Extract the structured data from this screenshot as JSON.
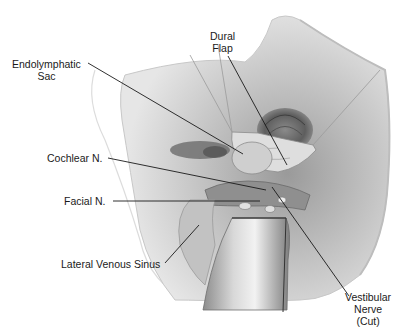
{
  "figure": {
    "labels": [
      {
        "id": "endolymphatic-sac",
        "lines": [
          "Endolymphatic",
          "Sac"
        ]
      },
      {
        "id": "dural-flap",
        "lines": [
          "Dural",
          "Flap"
        ]
      },
      {
        "id": "cochlear-n",
        "lines": [
          "Cochlear N."
        ]
      },
      {
        "id": "facial-n",
        "lines": [
          "Facial N."
        ]
      },
      {
        "id": "lateral-venous-sinus",
        "lines": [
          "Lateral Venous Sinus"
        ]
      },
      {
        "id": "vestibular-nerve",
        "lines": [
          "Vestibular",
          "Nerve",
          "(Cut)"
        ]
      }
    ]
  },
  "colors": {
    "background": "#ffffff",
    "tissue_light": "#d9d9d9",
    "tissue_mid": "#b5b5b5",
    "tissue_dark": "#7a7a7a",
    "leader_line": "#1a1a1a",
    "label_text": "#1a1a1a"
  }
}
